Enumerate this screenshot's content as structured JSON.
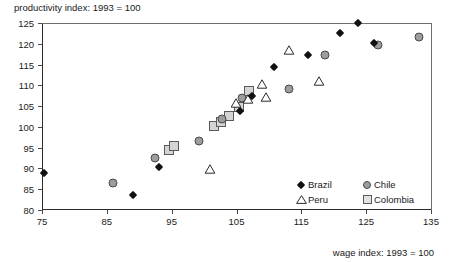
{
  "chart_data": {
    "type": "scatter",
    "title": "productivity index: 1993 = 100",
    "xlabel": "wage index: 1993 = 100",
    "ylabel": "productivity index: 1993 = 100",
    "xlim": [
      75,
      135
    ],
    "ylim": [
      80,
      125
    ],
    "xticks": [
      75,
      85,
      95,
      105,
      115,
      125,
      135
    ],
    "yticks": [
      80,
      85,
      90,
      95,
      100,
      105,
      110,
      115,
      120,
      125
    ],
    "grid": false,
    "legend_position": "inside bottom-right",
    "series": [
      {
        "name": "Brazil",
        "marker": "filled-diamond",
        "color": "#111111",
        "points": [
          [
            75.3,
            88.9
          ],
          [
            89.0,
            83.7
          ],
          [
            93.0,
            90.3
          ],
          [
            105.6,
            103.8
          ],
          [
            107.4,
            107.5
          ],
          [
            110.8,
            114.4
          ],
          [
            116.1,
            117.4
          ],
          [
            121.0,
            122.5
          ],
          [
            123.8,
            125.0
          ],
          [
            126.2,
            120.2
          ]
        ]
      },
      {
        "name": "Peru",
        "marker": "open-triangle",
        "color": "#2b2b2b",
        "points": [
          [
            100.1,
            89.9
          ],
          [
            104.2,
            105.8
          ],
          [
            106.0,
            106.6
          ],
          [
            108.2,
            110.3
          ],
          [
            108.8,
            107.1
          ],
          [
            112.4,
            118.5
          ],
          [
            117.0,
            111.0
          ]
        ]
      },
      {
        "name": "Chile",
        "marker": "filled-circle",
        "color": "#9d9d9d",
        "points": [
          [
            85.9,
            86.5
          ],
          [
            92.5,
            92.4
          ],
          [
            99.2,
            96.6
          ],
          [
            102.8,
            101.8
          ],
          [
            105.8,
            106.9
          ],
          [
            113.1,
            109.0
          ],
          [
            118.6,
            117.3
          ],
          [
            126.8,
            119.6
          ],
          [
            133.2,
            121.6
          ]
        ]
      },
      {
        "name": "Colombia",
        "marker": "open-square",
        "color": "#d4d4d4",
        "points": [
          [
            94.6,
            94.5
          ],
          [
            95.4,
            95.4
          ],
          [
            101.6,
            100.1
          ],
          [
            102.6,
            101.2
          ],
          [
            103.9,
            102.6
          ],
          [
            105.4,
            104.9
          ],
          [
            106.9,
            108.6
          ]
        ]
      }
    ]
  },
  "legend": {
    "entries": [
      {
        "label": "Brazil",
        "marker": "diamond-icon"
      },
      {
        "label": "Chile",
        "marker": "circle-icon"
      },
      {
        "label": "Peru",
        "marker": "triangle-icon"
      },
      {
        "label": "Colombia",
        "marker": "square-icon"
      }
    ]
  }
}
